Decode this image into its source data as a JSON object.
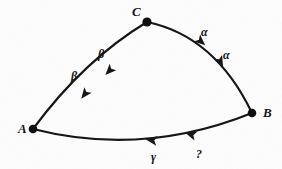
{
  "figure": {
    "kind": "curved-triangle-diagram",
    "background_color": "#fdfdfd",
    "ink_color": "#141414",
    "width": 282,
    "height": 169
  },
  "vertices": [
    {
      "id": "A",
      "label": "A",
      "x": 33,
      "y": 129,
      "label_x": 18,
      "label_y": 122
    },
    {
      "id": "B",
      "label": "B",
      "x": 252,
      "y": 113,
      "label_x": 263,
      "label_y": 106
    },
    {
      "id": "C",
      "label": "C",
      "x": 147,
      "y": 22,
      "label_x": 132,
      "label_y": 5
    }
  ],
  "edges": [
    {
      "id": "edge-CA",
      "from": "C",
      "to": "A",
      "arrow_direction": "C-to-A",
      "path": "M 147 22 Q 84 60 33 129",
      "stroke_width": 2.2,
      "labels": [
        "β",
        "β"
      ]
    },
    {
      "id": "edge-CB",
      "from": "C",
      "to": "B",
      "arrow_direction": "C-to-B",
      "path": "M 147 22 Q 215 36 252 113",
      "stroke_width": 2.2,
      "labels": [
        "α",
        "α"
      ]
    },
    {
      "id": "edge-BA",
      "from": "B",
      "to": "A",
      "arrow_direction": "B-to-A",
      "path": "M 252 113 Q 143 157 33 129",
      "stroke_width": 2.2,
      "labels": [
        "γ",
        "?"
      ]
    }
  ],
  "edge_labels": [
    {
      "id": "beta-lower",
      "text": "β",
      "x": 71,
      "y": 70,
      "edge": "edge-CA"
    },
    {
      "id": "beta-upper",
      "text": "β",
      "x": 98,
      "y": 48,
      "edge": "edge-CA"
    },
    {
      "id": "alpha-upper",
      "text": "α",
      "x": 201,
      "y": 26,
      "edge": "edge-CB"
    },
    {
      "id": "alpha-lower",
      "text": "α",
      "x": 223,
      "y": 49,
      "edge": "edge-CB"
    },
    {
      "id": "gamma-label",
      "text": "γ",
      "x": 151,
      "y": 151,
      "edge": "edge-BA"
    },
    {
      "id": "question-label",
      "text": "?",
      "x": 196,
      "y": 148,
      "edge": "edge-BA"
    }
  ],
  "arrow_markers": [
    {
      "id": "arrow-beta-lower",
      "on_edge": "edge-CA",
      "x": 88,
      "y": 90,
      "angle": 128,
      "size": 9
    },
    {
      "id": "arrow-beta-upper",
      "on_edge": "edge-CA",
      "x": 113,
      "y": 67,
      "angle": 134,
      "size": 9
    },
    {
      "id": "arrow-alpha-upper",
      "on_edge": "edge-CB",
      "x": 197,
      "y": 38,
      "angle": 42,
      "size": 9
    },
    {
      "id": "arrow-alpha-lower",
      "on_edge": "edge-CB",
      "x": 218,
      "y": 57,
      "angle": 63,
      "size": 9
    },
    {
      "id": "arrow-gamma",
      "on_edge": "edge-BA",
      "x": 157,
      "y": 141,
      "angle": 189,
      "size": 9
    },
    {
      "id": "arrow-question",
      "on_edge": "edge-BA",
      "x": 196,
      "y": 136,
      "angle": 198,
      "size": 9
    }
  ]
}
